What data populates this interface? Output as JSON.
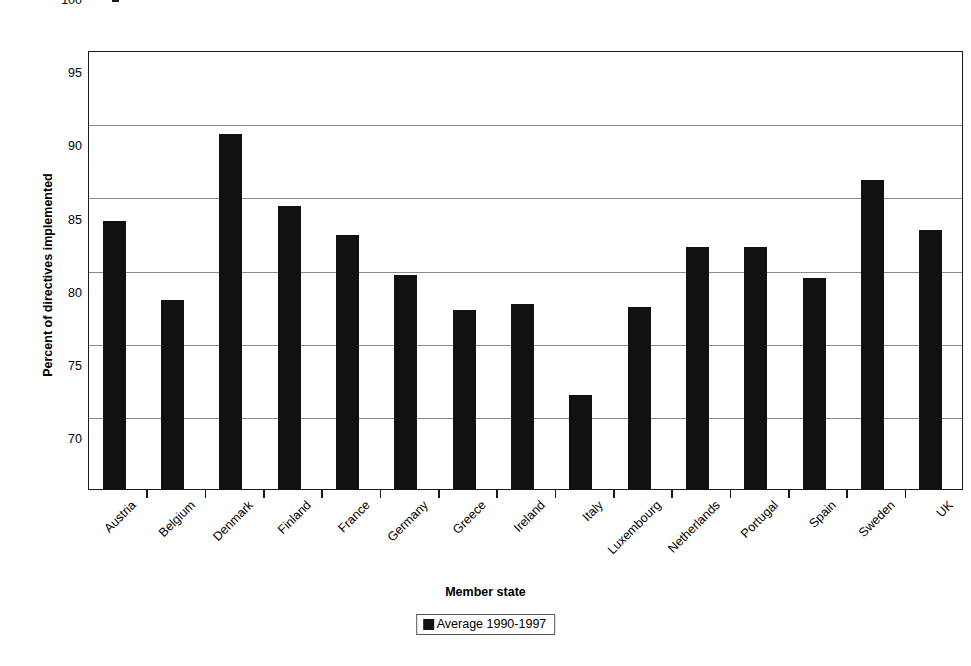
{
  "chart_data": {
    "type": "bar",
    "title": "",
    "xlabel": "Member state",
    "ylabel": "Percent of directives implemented",
    "ylim": [
      70,
      100
    ],
    "yticks": [
      70,
      75,
      80,
      85,
      90,
      95,
      100
    ],
    "grid": true,
    "legend_position": "bottom-center",
    "categories": [
      "Austria",
      "Belgium",
      "Denmark",
      "Finland",
      "France",
      "Germany",
      "Greece",
      "Ireland",
      "Italy",
      "Luxembourg",
      "Netherlands",
      "Portugal",
      "Spain",
      "Sweden",
      "UK"
    ],
    "series": [
      {
        "name": "Average 1990-1997",
        "color": "#111111",
        "values": [
          88.4,
          83.0,
          94.3,
          89.4,
          87.4,
          84.7,
          82.3,
          82.7,
          76.5,
          82.5,
          86.6,
          86.6,
          84.5,
          91.2,
          87.8
        ]
      }
    ]
  },
  "legend": {
    "entries": [
      {
        "label": "Average 1990-1997",
        "color": "#111111"
      }
    ]
  },
  "axis": {
    "y_title": "Percent of directives implemented",
    "x_title": "Member state"
  }
}
